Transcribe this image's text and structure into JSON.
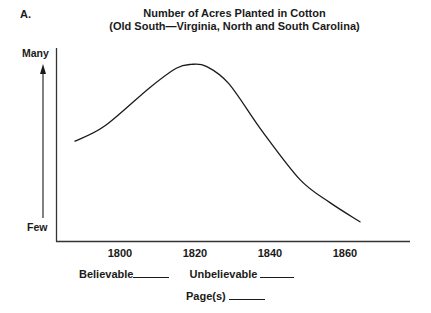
{
  "panel_label": "A.",
  "chart_data": {
    "type": "line",
    "title": "Number of Acres Planted in Cotton",
    "subtitle": "(Old South—Virginia, North and South Carolina)",
    "xlabel": "",
    "ylabel": "Number of acres (qualitative)",
    "y_axis_labels": {
      "top": "Many",
      "bottom": "Few"
    },
    "x_tick_labels": [
      "1800",
      "1820",
      "1840",
      "1860"
    ],
    "x_ticks": [
      1800,
      1820,
      1840,
      1860
    ],
    "xlim": [
      1782,
      1876
    ],
    "ylim": [
      0,
      100
    ],
    "grid": false,
    "legend": null,
    "series": [
      {
        "name": "Acres planted in cotton",
        "x": [
          1788,
          1796,
          1808,
          1815,
          1819,
          1823,
          1829,
          1838,
          1848,
          1856,
          1864
        ],
        "values": [
          52,
          60,
          80,
          90,
          92,
          91,
          82,
          57,
          32,
          20,
          10
        ]
      }
    ],
    "annotations": [
      "Arrow pointing upward from Few to Many along y-axis"
    ]
  },
  "footer": {
    "believable_label": "Believable",
    "unbelievable_label": "Unbelievable",
    "pages_label": "Page(s)"
  }
}
